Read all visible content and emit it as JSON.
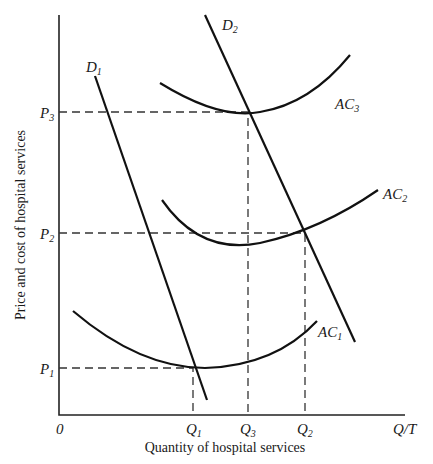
{
  "diagram": {
    "y_axis_title": "Price and cost of hospital services",
    "x_axis_title": "Quantity of hospital services",
    "origin_label": "0",
    "x_axis_end_label": "Q/T",
    "price_levels": [
      {
        "label": "P",
        "sub": "3"
      },
      {
        "label": "P",
        "sub": "2"
      },
      {
        "label": "P",
        "sub": "1"
      }
    ],
    "quantity_levels": [
      {
        "label": "Q",
        "sub": "1"
      },
      {
        "label": "Q",
        "sub": "3"
      },
      {
        "label": "Q",
        "sub": "2"
      }
    ],
    "curves": {
      "d1": {
        "label": "D",
        "sub": "1"
      },
      "d2": {
        "label": "D",
        "sub": "2"
      },
      "ac1": {
        "label": "AC",
        "sub": "1"
      },
      "ac2": {
        "label": "AC",
        "sub": "2"
      },
      "ac3": {
        "label": "AC",
        "sub": "3"
      }
    }
  }
}
